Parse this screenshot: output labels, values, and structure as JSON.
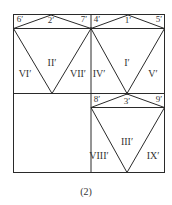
{
  "figure": {
    "caption": "(2)",
    "points": [
      {
        "id": "6p",
        "label": "6′",
        "x": 20,
        "y": 19
      },
      {
        "id": "2p",
        "label": "2′",
        "x": 51,
        "y": 19
      },
      {
        "id": "7p",
        "label": "7′",
        "x": 84,
        "y": 19
      },
      {
        "id": "4p",
        "label": "4′",
        "x": 96,
        "y": 19
      },
      {
        "id": "1p",
        "label": "1′",
        "x": 128,
        "y": 19
      },
      {
        "id": "5p",
        "label": "5′",
        "x": 159,
        "y": 19
      },
      {
        "id": "8p",
        "label": "8′",
        "x": 96,
        "y": 99
      },
      {
        "id": "3p",
        "label": "3′",
        "x": 127,
        "y": 100
      },
      {
        "id": "9p",
        "label": "9′",
        "x": 159,
        "y": 99
      }
    ],
    "regions": [
      {
        "id": "I",
        "label": "I′",
        "x": 127,
        "y": 63
      },
      {
        "id": "II",
        "label": "II′",
        "x": 52,
        "y": 63
      },
      {
        "id": "III",
        "label": "III′",
        "x": 127,
        "y": 142
      },
      {
        "id": "IV",
        "label": "IV′",
        "x": 99,
        "y": 74
      },
      {
        "id": "V",
        "label": "V′",
        "x": 153,
        "y": 74
      },
      {
        "id": "VI",
        "label": "VI′",
        "x": 25,
        "y": 74
      },
      {
        "id": "VII",
        "label": "VII′",
        "x": 78,
        "y": 74
      },
      {
        "id": "VIII",
        "label": "VIII′",
        "x": 99,
        "y": 156
      },
      {
        "id": "IX",
        "label": "IX′",
        "x": 153,
        "y": 156
      }
    ],
    "colors": {
      "stroke": "#2a2a2a",
      "text": "#333333"
    }
  }
}
